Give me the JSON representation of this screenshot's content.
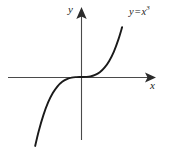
{
  "figure": {
    "name": "cubic-function-graph",
    "background_color": "#ffffff",
    "width": 169,
    "height": 149
  },
  "labels": {
    "y_axis": "y",
    "x_axis": "x",
    "equation_variable": "y",
    "equation_operator": "=",
    "equation_base": "x",
    "equation_exponent": "3",
    "equation_full": "y = x³"
  },
  "colors": {
    "curve": "#1a1a1a",
    "axis": "#4a4a4a",
    "text": "#1b1b1b"
  },
  "chart_data": {
    "type": "line",
    "title": "",
    "subtitle": "",
    "xlabel": "x",
    "ylabel": "y",
    "annotations": [
      "y = x³"
    ],
    "grid": false,
    "legend": null,
    "axis_style": "arrowed-cartesian-axes",
    "origin_px": [
      81,
      77
    ],
    "xlim": [
      -2.2,
      2.05
    ],
    "ylim": [
      -2.3,
      2.25
    ],
    "series": [
      {
        "name": "y = x³",
        "x": [
          -1.95,
          -1.8,
          -1.6,
          -1.4,
          -1.2,
          -1.0,
          -0.8,
          -0.6,
          -0.4,
          -0.2,
          0.0,
          0.2,
          0.4,
          0.6,
          0.8,
          1.0,
          1.2,
          1.4,
          1.6,
          1.75
        ],
        "values": [
          -7.41,
          -5.83,
          -4.1,
          -2.74,
          -1.73,
          -1.0,
          -0.51,
          -0.22,
          -0.06,
          -0.01,
          0.0,
          0.01,
          0.06,
          0.22,
          0.51,
          1.0,
          1.73,
          2.74,
          4.1,
          5.36
        ]
      }
    ]
  }
}
